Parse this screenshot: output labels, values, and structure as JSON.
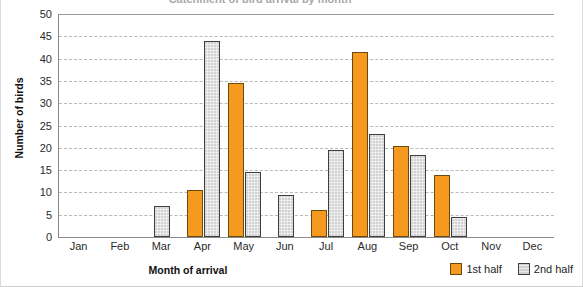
{
  "chart_data": {
    "type": "bar",
    "title": "Catchment of bird arrival by month",
    "xlabel": "Month of arrival",
    "ylabel": "Number of birds",
    "ylim": [
      0,
      50
    ],
    "ytick_step": 5,
    "yticks": [
      50,
      45,
      40,
      35,
      30,
      25,
      20,
      15,
      10,
      5,
      0
    ],
    "grid": true,
    "legend_position": "bottom-right",
    "categories": [
      "Jan",
      "Feb",
      "Mar",
      "Apr",
      "May",
      "Jun",
      "Jul",
      "Aug",
      "Sep",
      "Oct",
      "Nov",
      "Dec"
    ],
    "series": [
      {
        "name": "1st half",
        "color": "#F59A1E",
        "values": [
          0,
          0,
          0,
          10.5,
          34.5,
          0,
          6,
          41.5,
          20.5,
          14,
          0,
          0
        ]
      },
      {
        "name": "2nd half",
        "color": "#D2D2D2",
        "values": [
          0,
          0,
          7,
          44,
          14.5,
          9.5,
          19.5,
          23,
          18.5,
          4.5,
          0,
          0
        ]
      }
    ]
  },
  "legend": {
    "items": [
      {
        "label": "1st half",
        "swatch": "orange-swatch"
      },
      {
        "label": "2nd half",
        "swatch": "gray-swatch"
      }
    ]
  }
}
